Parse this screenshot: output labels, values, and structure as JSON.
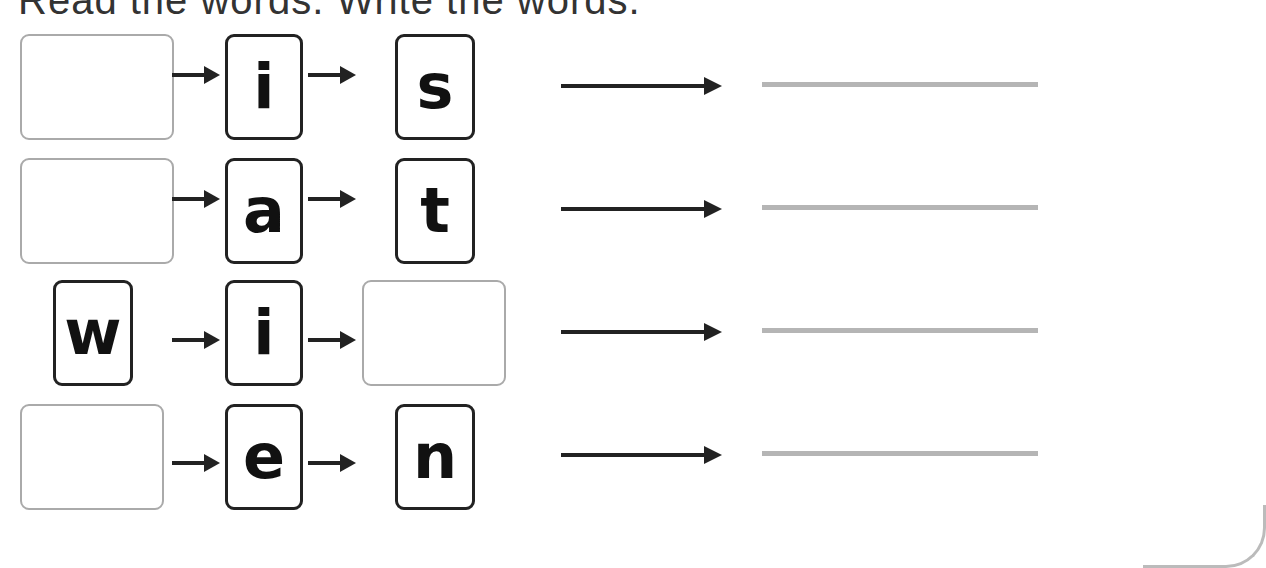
{
  "title": "Read the words. Write the words.",
  "rows": [
    {
      "first": "",
      "second": "i",
      "third": "s",
      "answer": ""
    },
    {
      "first": "",
      "second": "a",
      "third": "t",
      "answer": ""
    },
    {
      "first": "w",
      "second": "i",
      "third": "",
      "answer": ""
    },
    {
      "first": "",
      "second": "e",
      "third": "n",
      "answer": ""
    }
  ],
  "colors": {
    "letter_border": "#222222",
    "blank_border": "#aaaaaa",
    "write_line": "#b5b5b5"
  }
}
